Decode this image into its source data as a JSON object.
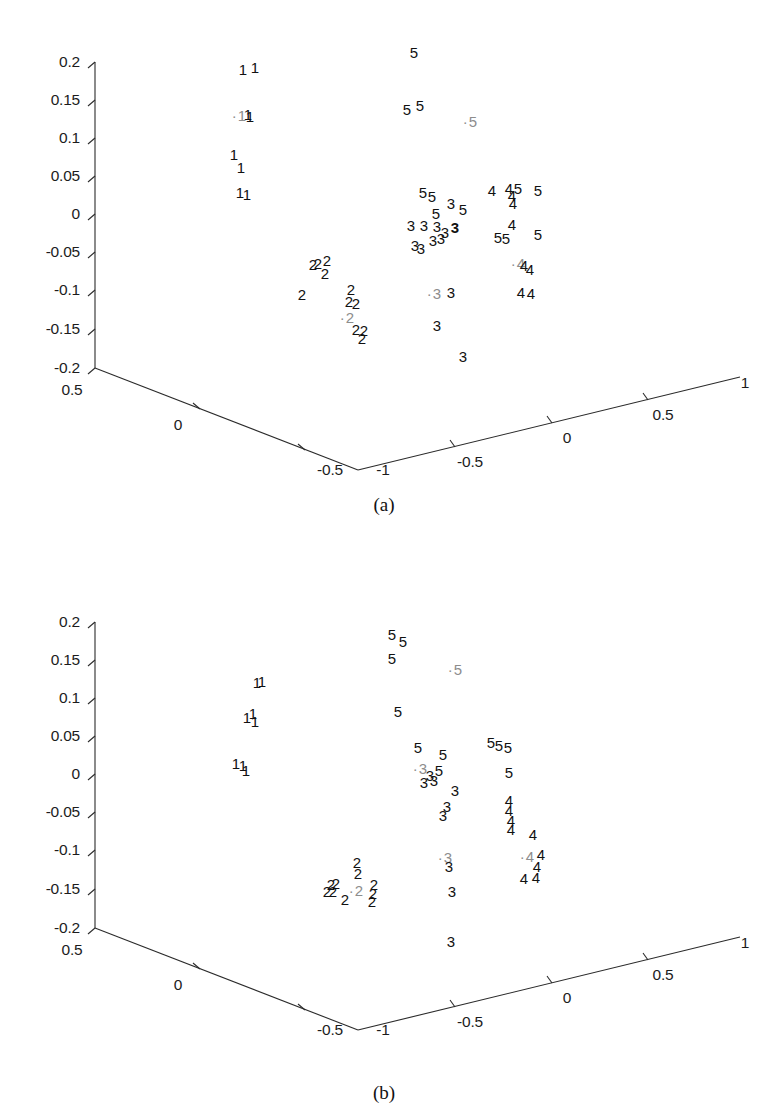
{
  "figure": {
    "background": "#ffffff",
    "ink": "#111111",
    "highlight_color": "#8d8d8d",
    "axis_color": "#2b2b2b"
  },
  "panels": [
    {
      "id": "a",
      "caption": "(a)",
      "z_axis": {
        "label": "",
        "ticks": [
          "0.2",
          "0.15",
          "0.1",
          "0.05",
          "0",
          "-0.05",
          "-0.1",
          "-0.15",
          "-0.2"
        ],
        "range": [
          -0.2,
          0.2
        ]
      },
      "x_axis_left": {
        "label": "",
        "ticks": [
          "0.5",
          "0",
          "-0.5"
        ],
        "range": [
          -0.5,
          0.5
        ]
      },
      "x_axis_right": {
        "label": "",
        "ticks": [
          "-1",
          "-0.5",
          "0",
          "0.5",
          "1"
        ],
        "range": [
          -1,
          1
        ]
      }
    },
    {
      "id": "b",
      "caption": "(b)",
      "z_axis": {
        "label": "",
        "ticks": [
          "0.2",
          "0.15",
          "0.1",
          "0.05",
          "0",
          "-0.05",
          "-0.1",
          "-0.15",
          "-0.2"
        ],
        "range": [
          -0.2,
          0.2
        ]
      },
      "x_axis_left": {
        "label": "",
        "ticks": [
          "0.5",
          "0",
          "-0.5"
        ],
        "range": [
          -0.5,
          0.5
        ]
      },
      "x_axis_right": {
        "label": "",
        "ticks": [
          "-1",
          "-0.5",
          "0",
          "0.5",
          "1"
        ],
        "range": [
          -1,
          1
        ]
      }
    }
  ],
  "chart_data": [
    {
      "type": "scatter",
      "title": "(a)",
      "xlabel": "",
      "ylabel": "",
      "zlabel": "",
      "projection": "3d",
      "grid": false,
      "legend": null,
      "marker_style": "class-digit-label",
      "classes": [
        "1",
        "2",
        "3",
        "4",
        "5"
      ],
      "axes": {
        "z_ticks": [
          0.2,
          0.15,
          0.1,
          0.05,
          0,
          -0.05,
          -0.1,
          -0.15,
          -0.2
        ],
        "x_left_ticks": [
          0.5,
          0,
          -0.5
        ],
        "x_right_ticks": [
          -1,
          -0.5,
          0,
          0.5,
          1
        ]
      },
      "points": [
        {
          "label": "1",
          "px": 243,
          "py": 69
        },
        {
          "label": "1",
          "px": 255,
          "py": 67
        },
        {
          "label": "1",
          "px": 239,
          "py": 115,
          "highlight": true
        },
        {
          "label": "1",
          "px": 248,
          "py": 114
        },
        {
          "label": "1",
          "px": 250,
          "py": 116
        },
        {
          "label": "1",
          "px": 234,
          "py": 154
        },
        {
          "label": "1",
          "px": 241,
          "py": 167
        },
        {
          "label": "1",
          "px": 240,
          "py": 192
        },
        {
          "label": "1",
          "px": 247,
          "py": 194
        },
        {
          "label": "5",
          "px": 414,
          "py": 52
        },
        {
          "label": "5",
          "px": 407,
          "py": 109
        },
        {
          "label": "5",
          "px": 420,
          "py": 105
        },
        {
          "label": "5",
          "px": 470,
          "py": 121,
          "highlight": true
        },
        {
          "label": "5",
          "px": 423,
          "py": 192
        },
        {
          "label": "5",
          "px": 432,
          "py": 196
        },
        {
          "label": "5",
          "px": 436,
          "py": 213
        },
        {
          "label": "5",
          "px": 463,
          "py": 209
        },
        {
          "label": "5",
          "px": 518,
          "py": 188
        },
        {
          "label": "5",
          "px": 538,
          "py": 190
        },
        {
          "label": "5",
          "px": 498,
          "py": 237
        },
        {
          "label": "5",
          "px": 506,
          "py": 238
        },
        {
          "label": "5",
          "px": 538,
          "py": 234
        },
        {
          "label": "3",
          "px": 451,
          "py": 203
        },
        {
          "label": "3",
          "px": 424,
          "py": 225
        },
        {
          "label": "3",
          "px": 437,
          "py": 226
        },
        {
          "label": "3",
          "px": 445,
          "py": 232
        },
        {
          "label": "3",
          "px": 433,
          "py": 240
        },
        {
          "label": "3",
          "px": 441,
          "py": 238
        },
        {
          "label": "3",
          "px": 455,
          "py": 227,
          "bold": true
        },
        {
          "label": "3",
          "px": 411,
          "py": 225
        },
        {
          "label": "3",
          "px": 415,
          "py": 245
        },
        {
          "label": "3",
          "px": 421,
          "py": 248
        },
        {
          "label": "3",
          "px": 434,
          "py": 293,
          "highlight": true
        },
        {
          "label": "3",
          "px": 451,
          "py": 292
        },
        {
          "label": "3",
          "px": 437,
          "py": 325
        },
        {
          "label": "3",
          "px": 463,
          "py": 356
        },
        {
          "label": "4",
          "px": 492,
          "py": 190
        },
        {
          "label": "4",
          "px": 509,
          "py": 188
        },
        {
          "label": "4",
          "px": 512,
          "py": 195
        },
        {
          "label": "4",
          "px": 513,
          "py": 203
        },
        {
          "label": "4",
          "px": 512,
          "py": 224
        },
        {
          "label": "4",
          "px": 518,
          "py": 263,
          "highlight": true
        },
        {
          "label": "4",
          "px": 524,
          "py": 265
        },
        {
          "label": "4",
          "px": 530,
          "py": 269
        },
        {
          "label": "4",
          "px": 521,
          "py": 292
        },
        {
          "label": "4",
          "px": 531,
          "py": 293
        },
        {
          "label": "2",
          "px": 313,
          "py": 264
        },
        {
          "label": "2",
          "px": 318,
          "py": 263
        },
        {
          "label": "2",
          "px": 327,
          "py": 260
        },
        {
          "label": "2",
          "px": 325,
          "py": 273
        },
        {
          "label": "2",
          "px": 302,
          "py": 294
        },
        {
          "label": "2",
          "px": 351,
          "py": 289
        },
        {
          "label": "2",
          "px": 349,
          "py": 301
        },
        {
          "label": "2",
          "px": 356,
          "py": 303
        },
        {
          "label": "2",
          "px": 347,
          "py": 317,
          "highlight": true
        },
        {
          "label": "2",
          "px": 356,
          "py": 329
        },
        {
          "label": "2",
          "px": 364,
          "py": 330
        },
        {
          "label": "2",
          "px": 362,
          "py": 338
        }
      ]
    },
    {
      "type": "scatter",
      "title": "(b)",
      "xlabel": "",
      "ylabel": "",
      "zlabel": "",
      "projection": "3d",
      "grid": false,
      "legend": null,
      "marker_style": "class-digit-label",
      "classes": [
        "1",
        "2",
        "3",
        "4",
        "5"
      ],
      "axes": {
        "z_ticks": [
          0.2,
          0.15,
          0.1,
          0.05,
          0,
          -0.05,
          -0.1,
          -0.15,
          -0.2
        ],
        "x_left_ticks": [
          0.5,
          0,
          -0.5
        ],
        "x_right_ticks": [
          -1,
          -0.5,
          0,
          0.5,
          1
        ]
      },
      "points": [
        {
          "label": "1",
          "px": 257,
          "py": 682
        },
        {
          "label": "1",
          "px": 262,
          "py": 681
        },
        {
          "label": "1",
          "px": 247,
          "py": 717
        },
        {
          "label": "1",
          "px": 253,
          "py": 713
        },
        {
          "label": "1",
          "px": 255,
          "py": 721
        },
        {
          "label": "1",
          "px": 236,
          "py": 763
        },
        {
          "label": "1",
          "px": 243,
          "py": 765
        },
        {
          "label": "1",
          "px": 246,
          "py": 770
        },
        {
          "label": "5",
          "px": 392,
          "py": 634
        },
        {
          "label": "5",
          "px": 403,
          "py": 641
        },
        {
          "label": "5",
          "px": 392,
          "py": 658
        },
        {
          "label": "5",
          "px": 455,
          "py": 669,
          "highlight": true
        },
        {
          "label": "5",
          "px": 398,
          "py": 711
        },
        {
          "label": "5",
          "px": 418,
          "py": 747
        },
        {
          "label": "5",
          "px": 443,
          "py": 754
        },
        {
          "label": "5",
          "px": 439,
          "py": 770
        },
        {
          "label": "5",
          "px": 491,
          "py": 742
        },
        {
          "label": "5",
          "px": 499,
          "py": 745
        },
        {
          "label": "5",
          "px": 508,
          "py": 747
        },
        {
          "label": "5",
          "px": 509,
          "py": 772
        },
        {
          "label": "3",
          "px": 420,
          "py": 768,
          "highlight": true
        },
        {
          "label": "3",
          "px": 430,
          "py": 775
        },
        {
          "label": "3",
          "px": 424,
          "py": 782
        },
        {
          "label": "3",
          "px": 434,
          "py": 780
        },
        {
          "label": "3",
          "px": 455,
          "py": 790
        },
        {
          "label": "3",
          "px": 447,
          "py": 806
        },
        {
          "label": "3",
          "px": 443,
          "py": 815
        },
        {
          "label": "3",
          "px": 445,
          "py": 857,
          "highlight": true
        },
        {
          "label": "3",
          "px": 449,
          "py": 866
        },
        {
          "label": "3",
          "px": 452,
          "py": 891
        },
        {
          "label": "3",
          "px": 451,
          "py": 941
        },
        {
          "label": "4",
          "px": 509,
          "py": 800
        },
        {
          "label": "4",
          "px": 509,
          "py": 810
        },
        {
          "label": "4",
          "px": 511,
          "py": 820
        },
        {
          "label": "4",
          "px": 511,
          "py": 829
        },
        {
          "label": "4",
          "px": 533,
          "py": 834
        },
        {
          "label": "4",
          "px": 527,
          "py": 856,
          "highlight": true
        },
        {
          "label": "4",
          "px": 541,
          "py": 854
        },
        {
          "label": "4",
          "px": 537,
          "py": 866
        },
        {
          "label": "4",
          "px": 524,
          "py": 878
        },
        {
          "label": "4",
          "px": 536,
          "py": 877
        },
        {
          "label": "2",
          "px": 357,
          "py": 862
        },
        {
          "label": "2",
          "px": 358,
          "py": 873
        },
        {
          "label": "2",
          "px": 331,
          "py": 884
        },
        {
          "label": "2",
          "px": 336,
          "py": 883
        },
        {
          "label": "2",
          "px": 327,
          "py": 891
        },
        {
          "label": "2",
          "px": 333,
          "py": 891
        },
        {
          "label": "2",
          "px": 345,
          "py": 899
        },
        {
          "label": "2",
          "px": 356,
          "py": 890,
          "highlight": true
        },
        {
          "label": "2",
          "px": 374,
          "py": 884
        },
        {
          "label": "2",
          "px": 373,
          "py": 893
        },
        {
          "label": "2",
          "px": 372,
          "py": 901
        }
      ]
    }
  ]
}
